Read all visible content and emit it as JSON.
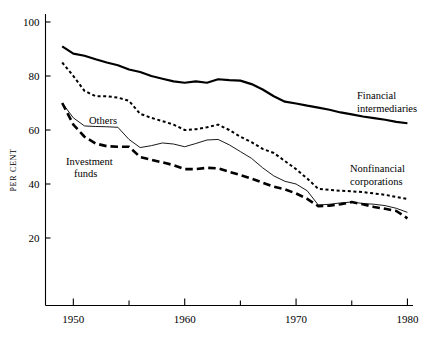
{
  "chart_data": {
    "type": "line",
    "title": "",
    "xlabel": "",
    "ylabel": "PER CENT",
    "xlim": [
      1947.5,
      1980.5
    ],
    "ylim": [
      0,
      104
    ],
    "grid": false,
    "legend_position": "inline-annotations",
    "x_ticks_major": [
      1950,
      1960,
      1970,
      1980
    ],
    "x_ticks_minor": [
      1955,
      1965,
      1975
    ],
    "y_ticks": [
      20,
      40,
      60,
      80,
      100
    ],
    "x_tick_labels": [
      "1950",
      "1960",
      "1970",
      "1980"
    ],
    "y_tick_labels": [
      "20",
      "40",
      "60",
      "80",
      "100"
    ],
    "x": [
      1949,
      1950,
      1951,
      1952,
      1953,
      1954,
      1955,
      1956,
      1957,
      1958,
      1959,
      1960,
      1961,
      1962,
      1963,
      1964,
      1965,
      1966,
      1967,
      1968,
      1969,
      1970,
      1971,
      1972,
      1973,
      1974,
      1975,
      1976,
      1977,
      1978,
      1979,
      1980
    ],
    "series": [
      {
        "name": "Financial intermediaries",
        "style": "solid-thick",
        "label": "Financial\nintermediaries",
        "label_line1": "Financial",
        "label_line2": "intermediaries",
        "values": [
          91.0,
          88.3,
          87.5,
          86.2,
          85.0,
          84.0,
          82.4,
          81.5,
          80.0,
          79.0,
          78.0,
          77.5,
          78.0,
          77.5,
          78.8,
          78.5,
          78.3,
          77.0,
          75.0,
          72.5,
          70.5,
          69.8,
          69.0,
          68.3,
          67.5,
          66.5,
          65.8,
          65.0,
          64.4,
          63.8,
          63.0,
          62.5
        ]
      },
      {
        "name": "Nonfinancial corporations",
        "style": "dotted",
        "label": "Nonfinancial\ncorporations",
        "label_line1": "Nonfinancial",
        "label_line2": "corporations",
        "values": [
          85.0,
          80.0,
          74.5,
          72.5,
          72.5,
          72.0,
          70.8,
          66.0,
          64.5,
          63.3,
          62.0,
          60.0,
          60.3,
          61.0,
          62.0,
          60.0,
          57.5,
          55.5,
          53.0,
          51.5,
          48.5,
          45.5,
          42.0,
          38.2,
          37.8,
          37.5,
          37.3,
          37.0,
          36.5,
          36.0,
          35.2,
          34.5
        ]
      },
      {
        "name": "Others",
        "style": "solid-thin",
        "label": "Others",
        "label_line1": "Others",
        "label_line2": "",
        "values": [
          70.0,
          64.5,
          61.5,
          61.3,
          61.2,
          61.0,
          56.5,
          53.5,
          54.2,
          55.2,
          54.8,
          53.8,
          55.0,
          56.3,
          56.5,
          54.5,
          52.0,
          49.5,
          46.0,
          43.0,
          41.0,
          40.0,
          37.5,
          32.2,
          32.5,
          33.0,
          33.3,
          32.8,
          32.5,
          32.0,
          31.0,
          29.5
        ]
      },
      {
        "name": "Investment funds",
        "style": "dashed-thick",
        "label": "Investment\nfunds",
        "label_line1": "Investment",
        "label_line2": "funds",
        "values": [
          70.0,
          62.0,
          57.5,
          55.0,
          54.0,
          53.8,
          53.8,
          50.0,
          49.0,
          48.0,
          47.0,
          45.5,
          45.5,
          46.0,
          45.8,
          44.5,
          43.3,
          42.0,
          40.5,
          39.0,
          38.0,
          36.5,
          34.5,
          31.8,
          32.0,
          32.5,
          33.3,
          32.5,
          31.5,
          30.8,
          30.0,
          27.3
        ]
      }
    ]
  },
  "annotations": {
    "financial_intermediaries_line1": "Financial",
    "financial_intermediaries_line2": "intermediaries",
    "nonfinancial_corporations_line1": "Nonfinancial",
    "nonfinancial_corporations_line2": "corporations",
    "others": "Others",
    "investment_funds_line1": "Investment",
    "investment_funds_line2": "funds"
  },
  "axes": {
    "y_axis_title": "PER CENT",
    "y_labels": [
      "100",
      "80",
      "60",
      "40",
      "20"
    ],
    "x_labels": [
      "1950",
      "1960",
      "1970",
      "1980"
    ]
  }
}
